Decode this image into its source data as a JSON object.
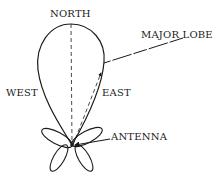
{
  "diagram": {
    "labels": {
      "north": "NORTH",
      "west": "WEST",
      "east": "EAST",
      "major_lobe": "MAJOR LOBE",
      "antenna": "ANTENNA"
    },
    "colors": {
      "stroke": "#1a1a1a",
      "background": "#ffffff"
    },
    "elements": [
      {
        "id": "major-lobe",
        "type": "teardrop-lobe",
        "direction": "north"
      },
      {
        "id": "minor-lobes",
        "type": "four-petal-lobes",
        "count": 4
      },
      {
        "id": "north-axis",
        "type": "dashed-line"
      },
      {
        "id": "east-vector",
        "type": "dashed-arrow"
      },
      {
        "id": "major-lobe-leader",
        "type": "leader-line"
      },
      {
        "id": "antenna-leader",
        "type": "leader-arrow"
      }
    ]
  }
}
